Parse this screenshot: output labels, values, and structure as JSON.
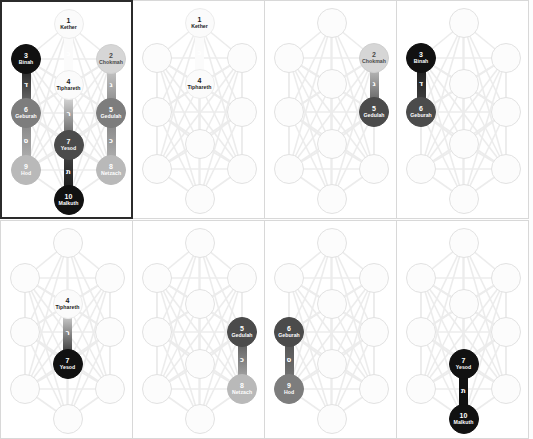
{
  "figure": {
    "sephiroth": [
      {
        "num": "1",
        "name": "Kether"
      },
      {
        "num": "2",
        "name": "Chokmah"
      },
      {
        "num": "3",
        "name": "Binah"
      },
      {
        "num": "4",
        "name": "Tiphareth"
      },
      {
        "num": "5",
        "name": "Gedulah"
      },
      {
        "num": "6",
        "name": "Geburah"
      },
      {
        "num": "7",
        "name": "Yesod"
      },
      {
        "num": "8",
        "name": "Netzach"
      },
      {
        "num": "9",
        "name": "Hod"
      },
      {
        "num": "10",
        "name": "Malkuth"
      }
    ],
    "path_letters": {
      "kether_tiphareth": "כ",
      "binah_geburah": "ד",
      "chokmah_gedulah": "ג",
      "geburah_hod": "ס",
      "gedulah_netzach": "כ",
      "tiphareth_yesod": "ר",
      "yesod_malkuth": "ת"
    },
    "colors": {
      "black": "#111111",
      "dark": "#4b4b4b",
      "mid": "#7d7d7d",
      "light": "#b9b9b9",
      "pale": "#d6d6d6",
      "white": "#fbfbfb",
      "frame_highlight": "#2b2b2b",
      "frame_normal": "#d8d8d8",
      "web_line": "#ececec"
    }
  },
  "panels": [
    {
      "id": "panel-1-full-tree",
      "highlighted": true,
      "active_nodes": [
        {
          "key": "kether",
          "num": "1",
          "name": "Kether",
          "tone": "white"
        },
        {
          "key": "chokmah",
          "num": "2",
          "name": "Chokmah",
          "tone": "pale"
        },
        {
          "key": "binah",
          "num": "3",
          "name": "Binah",
          "tone": "black"
        },
        {
          "key": "tiphareth",
          "num": "4",
          "name": "Tiphareth",
          "tone": "white"
        },
        {
          "key": "gedulah",
          "num": "5",
          "name": "Gedulah",
          "tone": "mid"
        },
        {
          "key": "geburah",
          "num": "6",
          "name": "Geburah",
          "tone": "mid"
        },
        {
          "key": "yesod",
          "num": "7",
          "name": "Yesod",
          "tone": "dark"
        },
        {
          "key": "netzach",
          "num": "8",
          "name": "Netzach",
          "tone": "light"
        },
        {
          "key": "hod",
          "num": "9",
          "name": "Hod",
          "tone": "light"
        },
        {
          "key": "malkuth",
          "num": "10",
          "name": "Malkuth",
          "tone": "black"
        }
      ],
      "active_paths": [
        {
          "from": "kether",
          "to": "tiphareth",
          "letter": "כ"
        },
        {
          "from": "binah",
          "to": "geburah",
          "letter": "ד"
        },
        {
          "from": "geburah",
          "to": "hod",
          "letter": "ס"
        },
        {
          "from": "chokmah",
          "to": "gedulah",
          "letter": "ג"
        },
        {
          "from": "gedulah",
          "to": "netzach",
          "letter": "כ"
        },
        {
          "from": "tiphareth",
          "to": "yesod",
          "letter": "ר"
        },
        {
          "from": "yesod",
          "to": "malkuth",
          "letter": "ת"
        }
      ]
    },
    {
      "id": "panel-2-kether-tiphareth",
      "highlighted": false,
      "active_nodes": [
        {
          "key": "kether",
          "num": "1",
          "name": "Kether",
          "tone": "white"
        },
        {
          "key": "tiphareth",
          "num": "4",
          "name": "Tiphareth",
          "tone": "white"
        }
      ],
      "active_paths": [
        {
          "from": "kether",
          "to": "tiphareth",
          "letter": "כ"
        }
      ]
    },
    {
      "id": "panel-3-chokmah-gedulah",
      "highlighted": false,
      "active_nodes": [
        {
          "key": "chokmah",
          "num": "2",
          "name": "Chokmah",
          "tone": "pale"
        },
        {
          "key": "gedulah",
          "num": "5",
          "name": "Gedulah",
          "tone": "dark"
        }
      ],
      "active_paths": [
        {
          "from": "chokmah",
          "to": "gedulah",
          "letter": "ג"
        }
      ]
    },
    {
      "id": "panel-4-binah-geburah",
      "highlighted": false,
      "active_nodes": [
        {
          "key": "binah",
          "num": "3",
          "name": "Binah",
          "tone": "black"
        },
        {
          "key": "geburah",
          "num": "6",
          "name": "Geburah",
          "tone": "dark"
        }
      ],
      "active_paths": [
        {
          "from": "binah",
          "to": "geburah",
          "letter": "ד"
        }
      ]
    },
    {
      "id": "panel-5-tiphareth-yesod",
      "highlighted": false,
      "active_nodes": [
        {
          "key": "tiphareth",
          "num": "4",
          "name": "Tiphareth",
          "tone": "white"
        },
        {
          "key": "yesod",
          "num": "7",
          "name": "Yesod",
          "tone": "black"
        }
      ],
      "active_paths": [
        {
          "from": "tiphareth",
          "to": "yesod",
          "letter": "ר"
        }
      ]
    },
    {
      "id": "panel-6-gedulah-netzach",
      "highlighted": false,
      "active_nodes": [
        {
          "key": "gedulah",
          "num": "5",
          "name": "Gedulah",
          "tone": "dark"
        },
        {
          "key": "netzach",
          "num": "8",
          "name": "Netzach",
          "tone": "light"
        }
      ],
      "active_paths": [
        {
          "from": "gedulah",
          "to": "netzach",
          "letter": "כ"
        }
      ]
    },
    {
      "id": "panel-7-geburah-hod",
      "highlighted": false,
      "active_nodes": [
        {
          "key": "geburah",
          "num": "6",
          "name": "Geburah",
          "tone": "dark"
        },
        {
          "key": "hod",
          "num": "9",
          "name": "Hod",
          "tone": "mid"
        }
      ],
      "active_paths": [
        {
          "from": "geburah",
          "to": "hod",
          "letter": "ס"
        }
      ]
    },
    {
      "id": "panel-8-yesod-malkuth",
      "highlighted": false,
      "active_nodes": [
        {
          "key": "yesod",
          "num": "7",
          "name": "Yesod",
          "tone": "black"
        },
        {
          "key": "malkuth",
          "num": "10",
          "name": "Malkuth",
          "tone": "black"
        }
      ],
      "active_paths": [
        {
          "from": "yesod",
          "to": "malkuth",
          "letter": "ת"
        }
      ]
    }
  ]
}
